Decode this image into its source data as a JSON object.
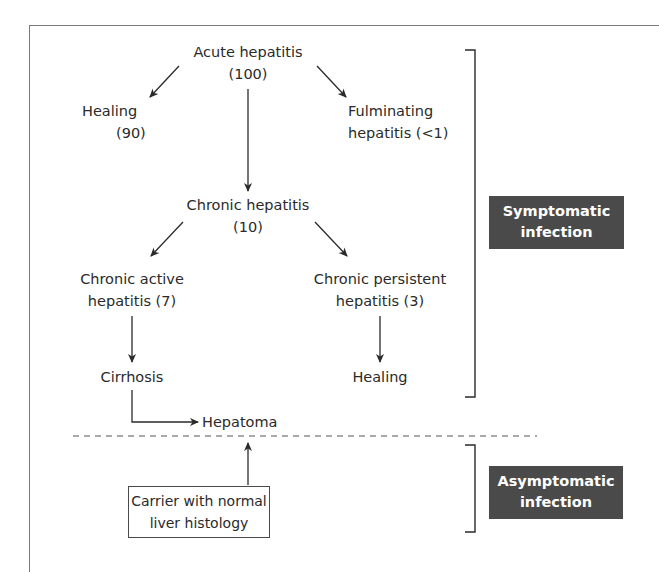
{
  "diagram": {
    "nodes": {
      "acute": {
        "line1": "Acute hepatitis",
        "line2": "(100)"
      },
      "healing_top": {
        "line1": "Healing",
        "line2": "(90)"
      },
      "fulminating": {
        "line1": "Fulminating",
        "line2": "hepatitis (<1)"
      },
      "chronic": {
        "line1": "Chronic hepatitis",
        "line2": "(10)"
      },
      "chronic_active": {
        "line1": "Chronic active",
        "line2": "hepatitis (7)"
      },
      "chronic_persistent": {
        "line1": "Chronic persistent",
        "line2": "hepatitis (3)"
      },
      "cirrhosis": {
        "line1": "Cirrhosis"
      },
      "healing_bottom": {
        "line1": "Healing"
      },
      "hepatoma": {
        "line1": "Hepatoma"
      },
      "carrier": {
        "line1": "Carrier with normal",
        "line2": "liver histology"
      }
    },
    "edges": [
      {
        "from": "Acute hepatitis",
        "to": "Healing"
      },
      {
        "from": "Acute hepatitis",
        "to": "Fulminating hepatitis"
      },
      {
        "from": "Acute hepatitis",
        "to": "Chronic hepatitis"
      },
      {
        "from": "Chronic hepatitis",
        "to": "Chronic active hepatitis"
      },
      {
        "from": "Chronic hepatitis",
        "to": "Chronic persistent hepatitis"
      },
      {
        "from": "Chronic active hepatitis",
        "to": "Cirrhosis"
      },
      {
        "from": "Chronic persistent hepatitis",
        "to": "Healing"
      },
      {
        "from": "Cirrhosis",
        "to": "Hepatoma"
      },
      {
        "from": "Carrier with normal liver histology",
        "to": "Hepatoma"
      }
    ],
    "groups": {
      "symptomatic": {
        "line1": "Symptomatic",
        "line2": "infection"
      },
      "asymptomatic": {
        "line1": "Asymptomatic",
        "line2": "infection"
      }
    },
    "colors": {
      "label_bg": "#4a4a4a",
      "label_text": "#ffffff",
      "line": "#2a2a2a",
      "frame": "#7a7a7a"
    }
  }
}
